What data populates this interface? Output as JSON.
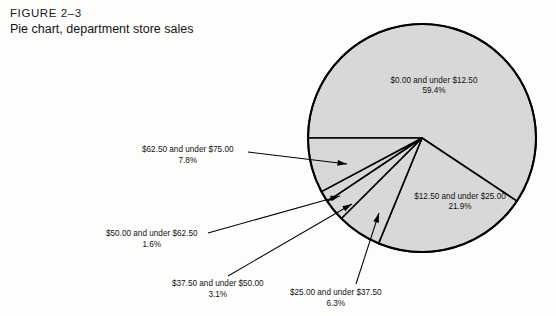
{
  "figure": {
    "number_label": "FIGURE 2–3",
    "title": "Pie chart, department store sales"
  },
  "colors": {
    "slice_fill": "#d8d8d8",
    "slice_stroke": "#000000",
    "text": "#111111",
    "page_background": "#fdfdfc"
  },
  "chart_data": {
    "type": "pie",
    "title": "Pie chart, department store sales",
    "xlabel": "",
    "ylabel": "",
    "legend_position": "none",
    "grid": false,
    "units": "percent",
    "start_angle_deg": 180,
    "direction": "clockwise",
    "center": {
      "x": 422,
      "y": 138
    },
    "radius": 114,
    "categories": [
      "$0.00 and under $12.50",
      "$12.50 and under $25.00",
      "$25.00 and under $37.50",
      "$37.50 and under $50.00",
      "$50.00 and under $62.50",
      "$62.50 and under $75.00"
    ],
    "values": [
      59.4,
      21.9,
      6.3,
      3.1,
      1.6,
      7.8
    ],
    "slices": [
      {
        "label": "$0.00 and under $12.50",
        "percent_text": "59.4%",
        "value": 59.4,
        "label_mode": "inside",
        "label_x": 434,
        "label_y": 83,
        "pct_x": 434,
        "pct_y": 93
      },
      {
        "label": "$12.50 and under $25.00",
        "percent_text": "21.9%",
        "value": 21.9,
        "label_mode": "inside",
        "label_x": 460,
        "label_y": 199,
        "pct_x": 460,
        "pct_y": 209
      },
      {
        "label": "$25.00 and under $37.50",
        "percent_text": "6.3%",
        "value": 6.3,
        "label_mode": "callout",
        "leader": {
          "x1": 356,
          "y1": 284,
          "x2": 379,
          "y2": 213
        }
      },
      {
        "label": "$37.50 and under $50.00",
        "percent_text": "3.1%",
        "value": 3.1,
        "label_mode": "callout",
        "leader": {
          "x1": 228,
          "y1": 276,
          "x2": 352,
          "y2": 204
        }
      },
      {
        "label": "$50.00 and under $62.50",
        "percent_text": "1.6%",
        "value": 1.6,
        "label_mode": "callout",
        "leader": {
          "x1": 208,
          "y1": 233,
          "x2": 340,
          "y2": 196
        }
      },
      {
        "label": "$62.50 and under $75.00",
        "percent_text": "7.8%",
        "value": 7.8,
        "label_mode": "callout",
        "leader": {
          "x1": 248,
          "y1": 152,
          "x2": 347,
          "y2": 164
        }
      }
    ]
  }
}
